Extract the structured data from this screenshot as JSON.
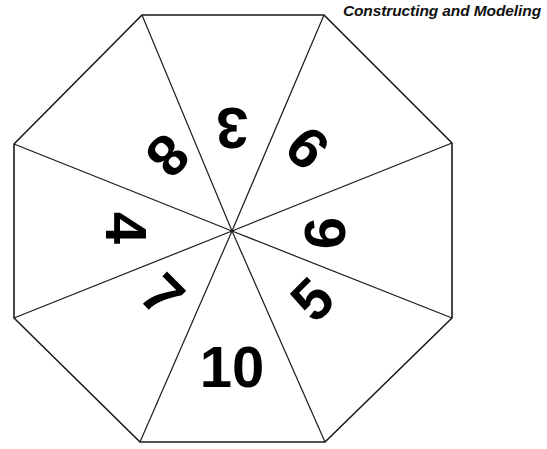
{
  "page": {
    "title": "Constructing and Modeling",
    "background_color": "#ffffff",
    "ink_color": "#000000"
  },
  "figure": {
    "name": "octagonal-spinner",
    "shape": "regular octagon",
    "sector_count": 8,
    "outline_color": "#1a1a1a",
    "outline_width": 1.6,
    "center": {
      "x": 232,
      "y": 231
    },
    "vertices": [
      {
        "x": 142,
        "y": 15
      },
      {
        "x": 324,
        "y": 15
      },
      {
        "x": 452,
        "y": 143
      },
      {
        "x": 452,
        "y": 318
      },
      {
        "x": 325,
        "y": 442
      },
      {
        "x": 140,
        "y": 442
      },
      {
        "x": 14,
        "y": 318
      },
      {
        "x": 14,
        "y": 144
      }
    ],
    "sectors": [
      {
        "label": "10",
        "position": "bottom",
        "rotation_deg": 0,
        "x": 232,
        "y": 366,
        "font_size": 60
      },
      {
        "label": "5",
        "position": "bottom-right",
        "rotation_deg": 315,
        "x": 312,
        "y": 299,
        "font_size": 58
      },
      {
        "label": "6",
        "position": "right",
        "rotation_deg": 270,
        "x": 324,
        "y": 233,
        "font_size": 58
      },
      {
        "label": "9",
        "position": "top-right",
        "rotation_deg": 225,
        "x": 307,
        "y": 148,
        "font_size": 58
      },
      {
        "label": "3",
        "position": "top",
        "rotation_deg": 180,
        "x": 232,
        "y": 128,
        "font_size": 58
      },
      {
        "label": "8",
        "position": "top-left",
        "rotation_deg": 135,
        "x": 168,
        "y": 156,
        "font_size": 58
      },
      {
        "label": "4",
        "position": "left",
        "rotation_deg": 90,
        "x": 126,
        "y": 228,
        "font_size": 58
      },
      {
        "label": "7",
        "position": "bottom-left",
        "rotation_deg": 45,
        "x": 163,
        "y": 295,
        "font_size": 58
      }
    ]
  }
}
